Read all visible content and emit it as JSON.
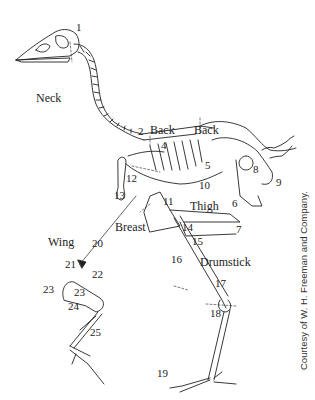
{
  "figure": {
    "region_labels": {
      "neck": "Neck",
      "back_1": "Back",
      "back_2": "Back",
      "wing": "Wing",
      "breast": "Breast",
      "thigh": "Thigh",
      "drumstick": "Drumstick"
    },
    "numbers": {
      "n1": "1",
      "n2": "2",
      "n4": "4",
      "n5": "5",
      "n6": "6",
      "n7": "7",
      "n8": "8",
      "n9": "9",
      "n10": "10",
      "n11": "11",
      "n12": "12",
      "n13": "13",
      "n14": "14",
      "n15": "15",
      "n16": "16",
      "n17": "17",
      "n18": "18",
      "n19": "19",
      "n20": "20",
      "n21": "21",
      "n22": "22",
      "n23a": "23",
      "n23b": "23",
      "n24": "24",
      "n25": "25"
    },
    "credit": "Courtesy of W. H. Freeman and Company."
  }
}
